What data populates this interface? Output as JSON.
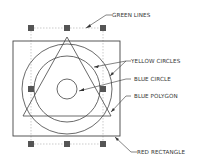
{
  "labels": {
    "green_lines": "GREEN LINES",
    "yellow_circles": "YELLOW CIRCLES",
    "blue_circle": "BLUE CIRCLE",
    "blue_polygon": "BLUE POLYGON",
    "red_rectangle": "RED RECTANGLE"
  },
  "colors": {
    "stroke": "#444444",
    "grip": "#555555",
    "dashed": "#aaaaaa",
    "background": "#ffffff"
  }
}
